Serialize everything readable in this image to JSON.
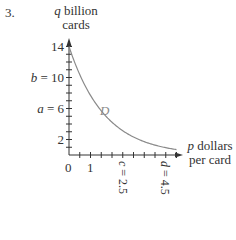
{
  "problem_number": "3.",
  "chart_data": {
    "type": "line",
    "title": "",
    "ylabel": {
      "var": "q",
      "text": "billion",
      "line2": "cards"
    },
    "xlabel": {
      "var": "p",
      "text": "dollars",
      "line2": "per card"
    },
    "xlim": [
      0,
      5
    ],
    "ylim": [
      0,
      14
    ],
    "x_ticks_minor_step": 0.5,
    "y_ticks_minor_step": 1,
    "x_tick_labels": [
      {
        "value": 0,
        "label": "0"
      },
      {
        "value": 1,
        "label": "1"
      },
      {
        "value": 2.5,
        "label": "c = 2.5",
        "rotated": true
      },
      {
        "value": 4.5,
        "label": "d = 4.5",
        "rotated": true
      }
    ],
    "y_tick_labels": [
      {
        "value": 14,
        "label": "14"
      },
      {
        "value": 10,
        "label": "b = 10"
      },
      {
        "value": 6,
        "label": "a = 6"
      },
      {
        "value": 2,
        "label": "2"
      }
    ],
    "series": [
      {
        "name": "D",
        "color": "#8a8a8a",
        "x": [
          0,
          0.5,
          1,
          1.5,
          2,
          2.5,
          3,
          3.5,
          4,
          4.5,
          5
        ],
        "values": [
          14,
          10.4,
          7.7,
          5.7,
          4.2,
          3.1,
          2.3,
          1.7,
          1.3,
          0.9,
          0.7
        ]
      }
    ],
    "curve_label": "D",
    "grid": false,
    "legend": "none"
  }
}
